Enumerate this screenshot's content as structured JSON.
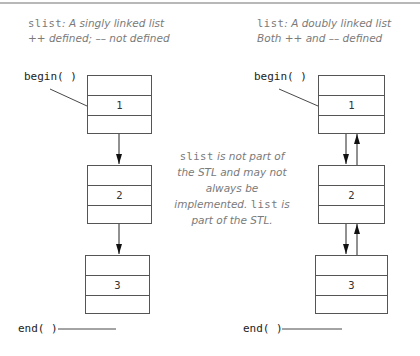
{
  "left": {
    "caption": {
      "code": "slist",
      "line1_rest": ": A singly linked list",
      "line2": "++ defined; –– not defined"
    },
    "begin_label": "begin( )",
    "end_label": "end( )",
    "nodes": [
      {
        "value": "1"
      },
      {
        "value": "2"
      },
      {
        "value": "3"
      }
    ]
  },
  "right": {
    "caption": {
      "code": "list",
      "line1_rest": ": A doubly linked list",
      "line2": "Both ++ and –– defined"
    },
    "begin_label": "begin( )",
    "end_label": "end( )",
    "nodes": [
      {
        "value": "1"
      },
      {
        "value": "2"
      },
      {
        "value": "3"
      }
    ]
  },
  "note": {
    "code1": "slist",
    "text1": " is not part of the STL and may not always be implemented. ",
    "code2": "list",
    "text2": " is part of the STL."
  },
  "colors": {
    "line": "#555555",
    "caption_text": "#7a7a7a",
    "label_text": "#222222"
  }
}
